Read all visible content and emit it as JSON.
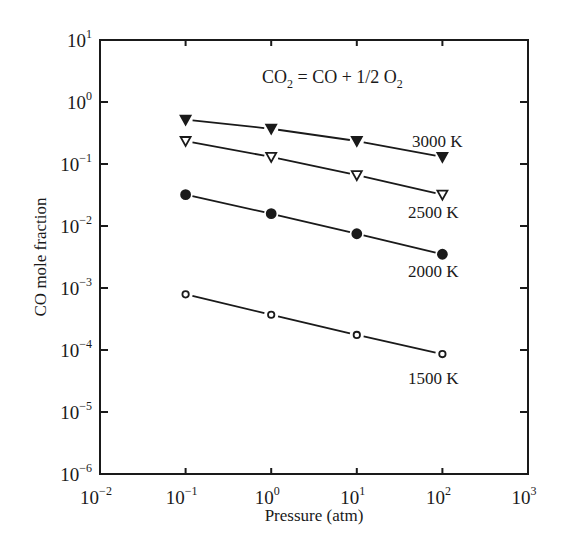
{
  "chart_data": {
    "type": "line",
    "title": "CO2 = CO + 1/2 O2",
    "annotation": {
      "parts": [
        "CO",
        "2",
        " = CO + 1/2 O",
        "2"
      ]
    },
    "xlabel": "Pressure (atm)",
    "ylabel": "CO mole fraction",
    "xscale": "log",
    "yscale": "log",
    "xlim": [
      0.01,
      1000
    ],
    "ylim": [
      1e-06,
      10
    ],
    "x_ticks": [
      {
        "base": "10",
        "exp": "−2",
        "value": 0.01
      },
      {
        "base": "10",
        "exp": "−1",
        "value": 0.1
      },
      {
        "base": "10",
        "exp": "0",
        "value": 1
      },
      {
        "base": "10",
        "exp": "1",
        "value": 10
      },
      {
        "base": "10",
        "exp": "2",
        "value": 100
      },
      {
        "base": "10",
        "exp": "3",
        "value": 1000
      }
    ],
    "y_ticks": [
      {
        "base": "10",
        "exp": "1",
        "value": 10
      },
      {
        "base": "10",
        "exp": "0",
        "value": 1
      },
      {
        "base": "10",
        "exp": "−1",
        "value": 0.1
      },
      {
        "base": "10",
        "exp": "−2",
        "value": 0.01
      },
      {
        "base": "10",
        "exp": "−3",
        "value": 0.001
      },
      {
        "base": "10",
        "exp": "−4",
        "value": 0.0001
      },
      {
        "base": "10",
        "exp": "−5",
        "value": 1e-05
      },
      {
        "base": "10",
        "exp": "−6",
        "value": 1e-06
      }
    ],
    "grid": false,
    "legend": "inline labels",
    "x": [
      0.1,
      1,
      10,
      100
    ],
    "series": [
      {
        "name": "3000 K",
        "marker": "filled-triangle-down",
        "values": [
          0.52,
          0.37,
          0.235,
          0.13
        ]
      },
      {
        "name": "2500 K",
        "marker": "open-triangle-down",
        "values": [
          0.235,
          0.13,
          0.066,
          0.032
        ]
      },
      {
        "name": "2000 K",
        "marker": "filled-circle",
        "values": [
          0.032,
          0.0158,
          0.0075,
          0.0035
        ]
      },
      {
        "name": "1500 K",
        "marker": "open-circle",
        "values": [
          0.00079,
          0.00037,
          0.000175,
          8.6e-05
        ]
      }
    ],
    "series_label_positions": [
      {
        "x": 412,
        "y": 147
      },
      {
        "x": 408,
        "y": 218
      },
      {
        "x": 408,
        "y": 277
      },
      {
        "x": 408,
        "y": 384
      }
    ],
    "colors": {
      "line": "#1a1a1a",
      "background": "#ffffff"
    }
  }
}
